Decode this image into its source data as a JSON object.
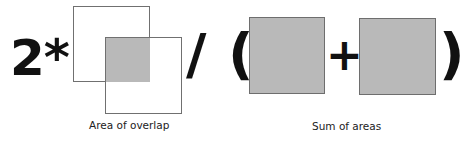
{
  "formula": {
    "multiplier": "2*",
    "divide": "/",
    "open_paren": "(",
    "plus": "+",
    "close_paren": ")"
  },
  "captions": {
    "overlap": "Area of overlap",
    "sum": "Sum of areas"
  },
  "colors": {
    "fill": "#b9b9b9",
    "border": "#707070",
    "text": "#111111"
  }
}
